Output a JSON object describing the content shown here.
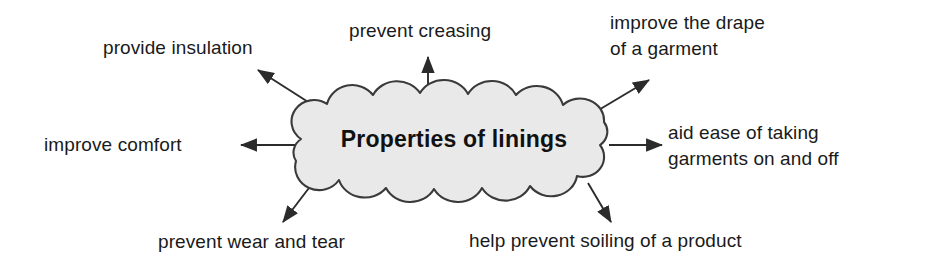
{
  "diagram": {
    "type": "mind-map",
    "center": {
      "label": "Properties of linings",
      "shape": "cloud",
      "fill_color": "#e9e9e9",
      "stroke_color": "#3a3a3a",
      "text_color": "#111111"
    },
    "branches": [
      {
        "id": "provide-insulation",
        "label": "provide insulation",
        "lines": [
          "provide insulation"
        ],
        "direction": "up-left",
        "arrow": {
          "from_x": 316,
          "from_y": 107,
          "to_x": 256,
          "to_y": 69
        }
      },
      {
        "id": "prevent-creasing",
        "label": "prevent creasing",
        "lines": [
          "prevent creasing"
        ],
        "direction": "up",
        "arrow": {
          "from_x": 428,
          "from_y": 98,
          "to_x": 428,
          "to_y": 55
        }
      },
      {
        "id": "improve-drape",
        "label": "improve the drape of a garment",
        "lines": [
          "improve the drape",
          "of a garment"
        ],
        "direction": "up-right",
        "arrow": {
          "from_x": 597,
          "from_y": 111,
          "to_x": 651,
          "to_y": 78
        }
      },
      {
        "id": "improve-comfort",
        "label": "improve comfort",
        "lines": [
          "improve comfort"
        ],
        "direction": "left",
        "arrow": {
          "from_x": 297,
          "from_y": 145,
          "to_x": 239,
          "to_y": 145
        }
      },
      {
        "id": "aid-ease",
        "label": "aid ease of taking garments on and off",
        "lines": [
          "aid ease of taking",
          "garments on and off"
        ],
        "direction": "right",
        "arrow": {
          "from_x": 609,
          "from_y": 145,
          "to_x": 664,
          "to_y": 145
        }
      },
      {
        "id": "prevent-wear",
        "label": "prevent wear and tear",
        "lines": [
          "prevent wear and tear"
        ],
        "direction": "down-left",
        "arrow": {
          "from_x": 312,
          "from_y": 184,
          "to_x": 281,
          "to_y": 224
        }
      },
      {
        "id": "help-prevent-soiling",
        "label": "help prevent soiling of a product",
        "lines": [
          "help prevent soiling of a product"
        ],
        "direction": "down-right",
        "arrow": {
          "from_x": 588,
          "from_y": 183,
          "to_x": 613,
          "to_y": 224
        }
      }
    ]
  }
}
